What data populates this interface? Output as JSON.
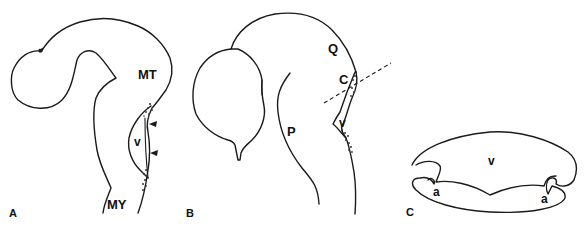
{
  "figure": {
    "panels": [
      {
        "id": "A",
        "label": "A",
        "structures": [
          {
            "key": "MT",
            "label": "MT"
          },
          {
            "key": "v",
            "label": "v"
          },
          {
            "key": "MY",
            "label": "MY"
          }
        ],
        "markers": [
          "arrowhead",
          "arrowhead"
        ]
      },
      {
        "id": "B",
        "label": "B",
        "structures": [
          {
            "key": "Q",
            "label": "Q"
          },
          {
            "key": "C",
            "label": "C"
          },
          {
            "key": "v",
            "label": "v"
          },
          {
            "key": "P",
            "label": "P"
          }
        ],
        "markers": [
          "dashed-section-line"
        ]
      },
      {
        "id": "C",
        "label": "C",
        "structures": [
          {
            "key": "v",
            "label": "v"
          },
          {
            "key": "a_left",
            "label": "a"
          },
          {
            "key": "a_right",
            "label": "a"
          }
        ]
      }
    ]
  },
  "colors": {
    "ink": "#1a1a1a",
    "background": "#ffffff"
  }
}
